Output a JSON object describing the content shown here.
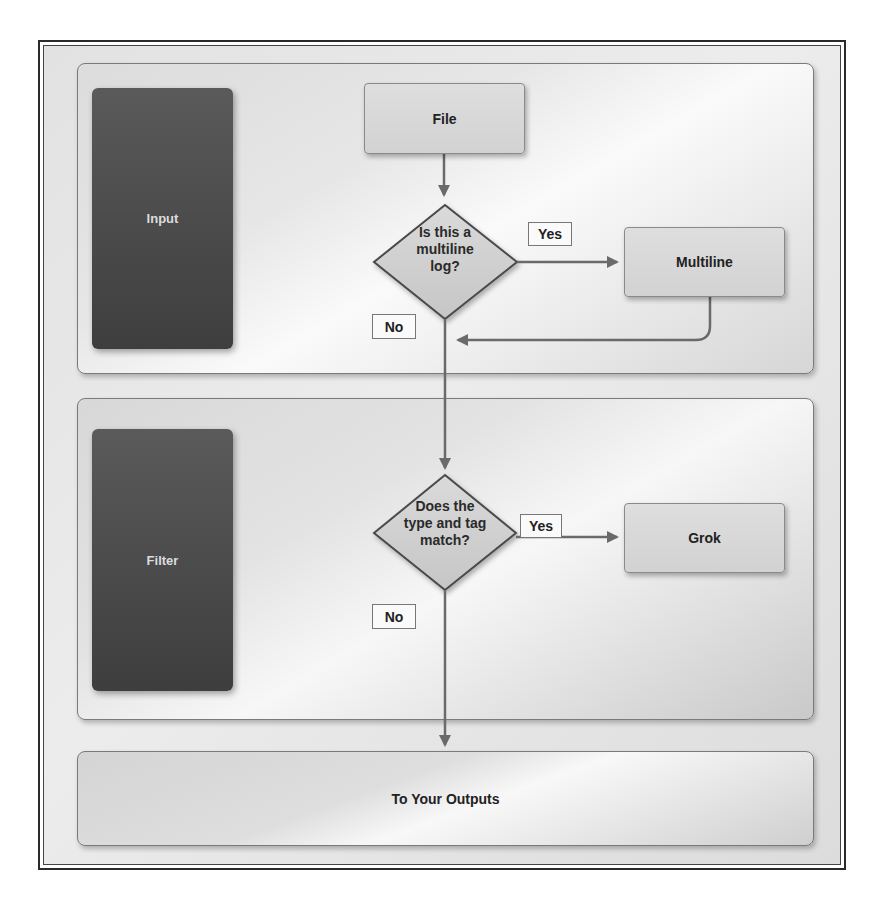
{
  "diagram": {
    "title": "",
    "lanes": [
      {
        "id": "input",
        "label": "Input"
      },
      {
        "id": "filter",
        "label": "Filter"
      },
      {
        "id": "output",
        "label": "To Your Outputs"
      }
    ],
    "nodes": {
      "file": {
        "label": "File",
        "shape": "rectangle"
      },
      "decision_multiline": {
        "label": "Is this a multiline log?",
        "lines": [
          "Is this a",
          "multiline",
          "log?"
        ],
        "shape": "diamond"
      },
      "multiline": {
        "label": "Multiline",
        "shape": "rectangle"
      },
      "decision_match": {
        "label": "Does the type and tag match?",
        "lines": [
          "Does the",
          "type and tag",
          "match?"
        ],
        "shape": "diamond"
      },
      "grok": {
        "label": "Grok",
        "shape": "rectangle"
      }
    },
    "edge_labels": {
      "yes_1": "Yes",
      "no_1": "No",
      "yes_2": "Yes",
      "no_2": "No"
    },
    "edges": [
      {
        "from": "file",
        "to": "decision_multiline",
        "label": ""
      },
      {
        "from": "decision_multiline",
        "to": "multiline",
        "label": "Yes"
      },
      {
        "from": "multiline",
        "to": "main_flow",
        "label": ""
      },
      {
        "from": "decision_multiline",
        "to": "decision_match",
        "label": "No"
      },
      {
        "from": "decision_match",
        "to": "grok",
        "label": "Yes"
      },
      {
        "from": "decision_match",
        "to": "output",
        "label": "No"
      }
    ]
  },
  "colors": {
    "lane_label_bg": "#4c4c4c",
    "lane_label_text": "#dcdcdc",
    "node_fill": "#d6d6d6",
    "edge": "#6a6a6a",
    "border": "#2a2a2a"
  }
}
